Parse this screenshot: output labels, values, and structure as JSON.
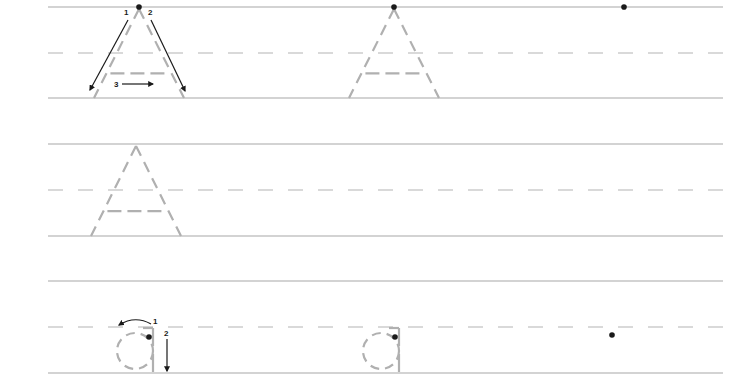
{
  "worksheet": {
    "type": "handwriting-practice",
    "colors": {
      "solid_line": "#a8a8a8",
      "dashed_line": "#b4b4b4",
      "trace_letter": "#b0b0b0",
      "ink": "#1a1a1a"
    },
    "rows": [
      {
        "letter": "A",
        "case": "uppercase",
        "top_y": 7,
        "mid_y": 53,
        "base_y": 98,
        "models": [
          {
            "x": 139,
            "with_arrows": true,
            "start_dot": true
          },
          {
            "x": 394,
            "with_arrows": false,
            "start_dot": true
          }
        ],
        "extra_dots": [
          {
            "x": 624,
            "y": 7
          }
        ],
        "stroke_labels": [
          "1",
          "2",
          "3"
        ]
      },
      {
        "letter": "A",
        "case": "uppercase",
        "top_y": 144,
        "mid_y": 190,
        "base_y": 236,
        "models": [
          {
            "x": 136,
            "with_arrows": false,
            "start_dot": false
          }
        ],
        "extra_dots": []
      },
      {
        "letter": "a",
        "case": "lowercase",
        "top_y": 281,
        "mid_y": 327,
        "base_y": 373,
        "models": [
          {
            "x": 137,
            "with_arrows": true,
            "start_dot": true
          },
          {
            "x": 383,
            "with_arrows": false,
            "start_dot": true
          }
        ],
        "extra_dots": [
          {
            "x": 612,
            "y": 335
          }
        ],
        "stroke_labels": [
          "1",
          "2"
        ]
      }
    ]
  }
}
